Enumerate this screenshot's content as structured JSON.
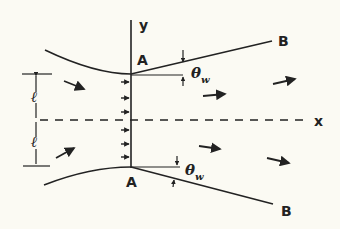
{
  "figure": {
    "axis_labels": {
      "x": "x",
      "y": "y"
    },
    "points": {
      "throat_top": "A",
      "throat_bottom": "A",
      "wall_end_top": "B",
      "wall_end_bottom": "B"
    },
    "angle_label": {
      "symbol": "θ",
      "subscript": "w"
    },
    "half_width_label": "ℓ",
    "colors": {
      "background": "#fbfaf3",
      "ink": "#222222"
    }
  }
}
